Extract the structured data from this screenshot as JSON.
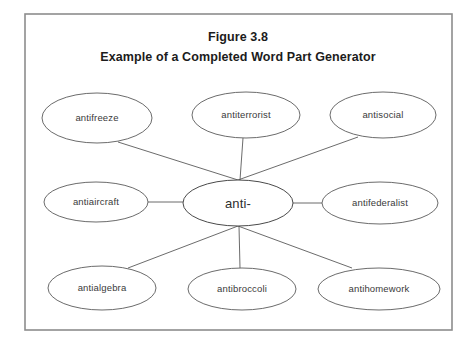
{
  "figure": {
    "title_line1": "Figure 3.8",
    "title_line2": "Example of a Completed Word Part Generator",
    "frame": {
      "x": 25,
      "y": 14,
      "width": 427,
      "height": 316
    },
    "colors": {
      "background": "#ffffff",
      "frame_border": "#8d8d8d",
      "node_border": "#5a5a5a",
      "node_fill": "#ffffff",
      "title_text": "#1c1c1c",
      "node_text": "#3a3a3a",
      "connector": "#5a5a5a"
    },
    "center_node": {
      "label": "anti-",
      "cx": 238,
      "cy": 203,
      "rx": 55,
      "ry": 23
    },
    "nodes": [
      {
        "id": "antifreeze",
        "label": "antifreeze",
        "cx": 97,
        "cy": 118,
        "rx": 55,
        "ry": 25,
        "row": "top"
      },
      {
        "id": "antiterrorist",
        "label": "antiterrorist",
        "cx": 246,
        "cy": 115,
        "rx": 54,
        "ry": 23,
        "row": "top"
      },
      {
        "id": "antisocial",
        "label": "antisocial",
        "cx": 383,
        "cy": 115,
        "rx": 53,
        "ry": 23,
        "row": "top"
      },
      {
        "id": "antiaircraft",
        "label": "antiaircraft",
        "cx": 96,
        "cy": 202,
        "rx": 52,
        "ry": 20,
        "row": "middle"
      },
      {
        "id": "antifederalist",
        "label": "antifederalist",
        "cx": 380,
        "cy": 203,
        "rx": 58,
        "ry": 21,
        "row": "middle"
      },
      {
        "id": "antialgebra",
        "label": "antialgebra",
        "cx": 102,
        "cy": 288,
        "rx": 54,
        "ry": 22,
        "row": "bottom"
      },
      {
        "id": "antibroccoli",
        "label": "antibroccoli",
        "cx": 242,
        "cy": 289,
        "rx": 54,
        "ry": 21,
        "row": "bottom"
      },
      {
        "id": "antihomework",
        "label": "antihomework",
        "cx": 379,
        "cy": 289,
        "rx": 61,
        "ry": 21,
        "row": "bottom"
      }
    ],
    "connectors": [
      {
        "from": "anti-",
        "to": "antifreeze",
        "x1": 238,
        "y1": 180,
        "x2": 118,
        "y2": 142
      },
      {
        "from": "anti-",
        "to": "antiterrorist",
        "x1": 240,
        "y1": 180,
        "x2": 243,
        "y2": 138
      },
      {
        "from": "anti-",
        "to": "antisocial",
        "x1": 238,
        "y1": 180,
        "x2": 358,
        "y2": 137
      },
      {
        "from": "anti-",
        "to": "antiaircraft",
        "x1": 183,
        "y1": 202,
        "x2": 148,
        "y2": 202
      },
      {
        "from": "anti-",
        "to": "antifederalist",
        "x1": 293,
        "y1": 203,
        "x2": 322,
        "y2": 203
      },
      {
        "from": "anti-",
        "to": "antialgebra",
        "x1": 238,
        "y1": 226,
        "x2": 128,
        "y2": 268
      },
      {
        "from": "anti-",
        "to": "antibroccoli",
        "x1": 239,
        "y1": 226,
        "x2": 240,
        "y2": 268
      },
      {
        "from": "anti-",
        "to": "antihomework",
        "x1": 238,
        "y1": 226,
        "x2": 352,
        "y2": 268
      }
    ]
  }
}
